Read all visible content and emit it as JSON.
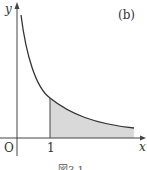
{
  "figure": {
    "panel_label": "(b)",
    "axis_x_label": "x",
    "axis_y_label": "y",
    "origin_label": "O",
    "tick_label_1": "1",
    "caption": "図3.1",
    "curve": "decreasing hyperbola-like curve y = 1/x^k",
    "shaded_region": "area under curve for x ≥ 1",
    "colors": {
      "line": "#333333",
      "shade": "#d9d9d9"
    }
  }
}
